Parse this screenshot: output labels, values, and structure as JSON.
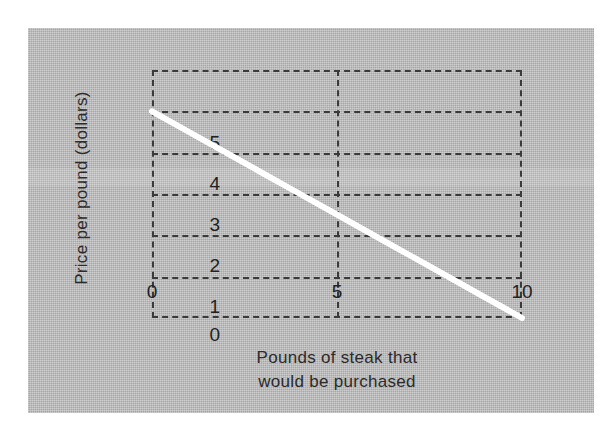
{
  "figure": {
    "background_color": "#b9b9b9",
    "page_color": "#ffffff",
    "line_color": "#ffffff",
    "grid_color": "#3a3a3a"
  },
  "chart_data": {
    "type": "line",
    "title": "",
    "subtitle": "",
    "xlabel": "Pounds of steak that would be purchased",
    "xlabel_line1": "Pounds of steak that",
    "xlabel_line2": "would be purchased",
    "ylabel": "Price per pound (dollars)",
    "xlim": [
      0,
      10
    ],
    "ylim": [
      0,
      6
    ],
    "xticks": [
      0,
      5,
      10
    ],
    "xtick_labels": [
      "0",
      "5",
      "10"
    ],
    "yticks": [
      0,
      1,
      2,
      3,
      4,
      5
    ],
    "ytick_labels": [
      "0",
      "1",
      "2",
      "3",
      "4",
      "5"
    ],
    "grid": true,
    "grid_style": "dashed",
    "legend": null,
    "legend_position": "none",
    "series": [
      {
        "name": "Demand curve",
        "color": "#ffffff",
        "line_width": 6,
        "x": [
          0,
          1,
          2,
          3,
          4,
          5,
          6,
          7,
          8,
          9,
          10
        ],
        "y": [
          5,
          4.5,
          4,
          3.5,
          3,
          2.5,
          2,
          1.5,
          1,
          0.5,
          0
        ]
      }
    ],
    "annotations": []
  }
}
